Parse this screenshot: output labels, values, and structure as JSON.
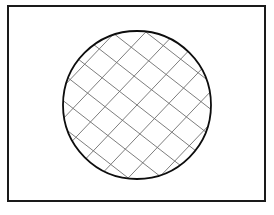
{
  "figure": {
    "title": "Cross-hatched circle inside rectangular frame",
    "canvas": {
      "width": 274,
      "height": 215,
      "background": "#ffffff"
    },
    "frame": {
      "label": "rectangular border",
      "x": 8,
      "y": 6,
      "width": 257,
      "height": 195,
      "stroke_color": "#1a1a1a",
      "stroke_width": 2,
      "fill": "none"
    },
    "circle": {
      "label": "circle outline",
      "center_x": 137,
      "center_y": 105,
      "radius": 74,
      "stroke_color": "#0d0d0d",
      "stroke_width": 1.8,
      "fill": "#ffffff"
    },
    "hatching": {
      "label": "diagonal cross-hatch fill",
      "stroke_color": "#6e6e6e",
      "stroke_width": 0.9,
      "sets": [
        {
          "name": "down-right-lines",
          "direction": "down-right",
          "slope": 0.78,
          "spacing": 21,
          "count": 13
        },
        {
          "name": "down-left-lines",
          "direction": "down-left",
          "slope": -1.05,
          "spacing": 22,
          "count": 13
        }
      ]
    }
  }
}
